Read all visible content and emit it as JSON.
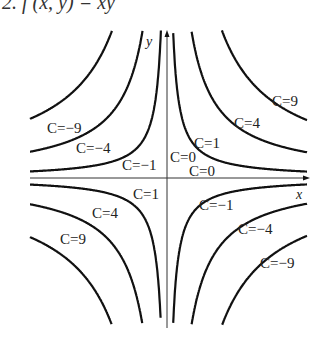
{
  "header": {
    "text": "2. f (x, y) = xy"
  },
  "chart_data": {
    "type": "contour",
    "function": "xy = C",
    "xlabel": "x",
    "ylabel": "y",
    "levels": [
      -9,
      -4,
      -1,
      0,
      1,
      4,
      9
    ],
    "labels": [
      {
        "text": "C=9",
        "quadrant": "I"
      },
      {
        "text": "C=4",
        "quadrant": "I"
      },
      {
        "text": "C=1",
        "quadrant": "I"
      },
      {
        "text": "C=0",
        "position": "y-axis"
      },
      {
        "text": "C=0",
        "position": "x-axis"
      },
      {
        "text": "C=-9",
        "quadrant": "II"
      },
      {
        "text": "C=-4",
        "quadrant": "II"
      },
      {
        "text": "C=-1",
        "quadrant": "II"
      },
      {
        "text": "C=1",
        "quadrant": "III"
      },
      {
        "text": "C=4",
        "quadrant": "III"
      },
      {
        "text": "C=9",
        "quadrant": "III"
      },
      {
        "text": "C=-1",
        "quadrant": "IV"
      },
      {
        "text": "C=-4",
        "quadrant": "IV"
      },
      {
        "text": "C=-9",
        "quadrant": "IV"
      }
    ],
    "grid": false
  },
  "labels": {
    "x_axis": "x",
    "y_axis": "y",
    "q1": [
      "C=9",
      "C=4",
      "C=1"
    ],
    "q2": [
      "C=−9",
      "C=−4",
      "C=−1"
    ],
    "q3": [
      "C=1",
      "C=4",
      "C=9"
    ],
    "q4": [
      "C=−1",
      "C=−4",
      "C=−9"
    ],
    "c0_y": "C=0",
    "c0_x": "C=0"
  }
}
